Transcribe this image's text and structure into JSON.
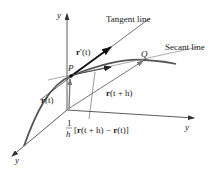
{
  "diagram": {
    "type": "vector-calculus-derivative-of-vector-function",
    "colors": {
      "background": "#ffffff",
      "axis": "#333333",
      "curve": "#555555",
      "tangent": "#222222",
      "secant": "#777777",
      "text": "#222222"
    },
    "axes": {
      "vertical_label": "y",
      "right_label": "y",
      "lower_left_label": "y"
    },
    "points": {
      "P": "P",
      "Q": "Q"
    },
    "lines": {
      "tangent_label": "Tangent line",
      "secant_label": "Secant line"
    },
    "vectors": {
      "r_t_bold": "r",
      "r_t_arg": "(t)",
      "r_prime_bold": "r",
      "r_prime_arg": "′(t)",
      "r_t_plus_h_bold": "r",
      "r_t_plus_h_arg": "(t + h)",
      "difference_quotient": {
        "numerator": "1",
        "denominator": "h",
        "bracket_open": "[",
        "r1_bold": "r",
        "r1_arg": "(t + h) − ",
        "r2_bold": "r",
        "r2_arg": "(t)",
        "bracket_close": "]"
      }
    }
  }
}
